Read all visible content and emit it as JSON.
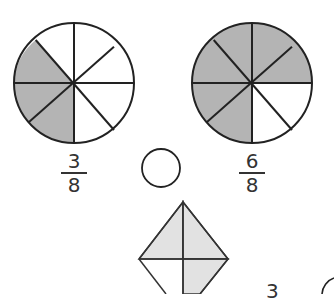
{
  "figures": {
    "left_circle": {
      "parts": 8,
      "shaded": 3,
      "fraction": {
        "numerator": "3",
        "denominator": "8"
      }
    },
    "right_circle": {
      "parts": 8,
      "shaded": 6,
      "fraction": {
        "numerator": "6",
        "denominator": "8"
      }
    },
    "compare_circle": {
      "value": ""
    },
    "diamond": {
      "parts": 4,
      "shaded_visible": 3
    },
    "partial_bottom_text": "3"
  },
  "colors": {
    "shade_dark": "#b4b4b4",
    "shade_light": "#e2e2e2",
    "stroke": "#222222"
  }
}
